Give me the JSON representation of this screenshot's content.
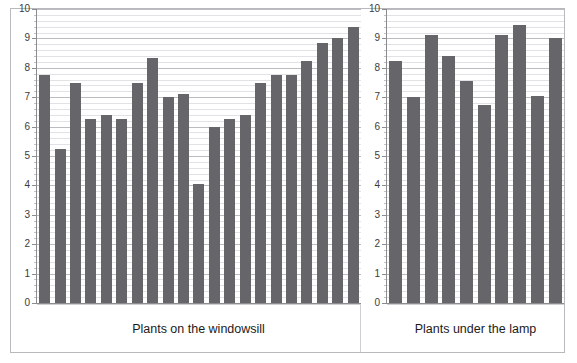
{
  "chart_data": {
    "type": "bar",
    "title": "",
    "xlabel": "",
    "ylabel": "",
    "ylim": [
      0,
      10
    ],
    "yticks": [
      0,
      1,
      2,
      3,
      4,
      5,
      6,
      7,
      8,
      9,
      10
    ],
    "ytick_labels": [
      "0",
      "1",
      "2",
      "3",
      "4",
      "5",
      "6",
      "7",
      "8",
      "9",
      "10"
    ],
    "grid": true,
    "minor_grid_step": 0.2,
    "legend": "none",
    "bar_color": "#66666a",
    "grid_color": "#bcbcc0",
    "minor_grid_color": "#e2e2e6",
    "axis_color": "#8c8c90",
    "panels": [
      {
        "label": "Plants on the windowsill",
        "values": [
          7.75,
          5.25,
          7.5,
          6.25,
          6.4,
          6.25,
          7.5,
          8.35,
          7.0,
          7.1,
          4.05,
          6.0,
          6.25,
          6.4,
          7.5,
          7.75,
          7.75,
          8.25,
          8.85,
          9.0,
          9.4
        ]
      },
      {
        "label": "Plants under the lamp",
        "values": [
          8.25,
          7.0,
          9.1,
          8.4,
          7.55,
          6.75,
          9.1,
          9.45,
          7.05,
          9.0
        ]
      }
    ]
  },
  "axes": {
    "left": {
      "labels": [
        "10",
        "9",
        "8",
        "7",
        "6",
        "5",
        "4",
        "3",
        "2",
        "1",
        "0"
      ]
    },
    "right": {
      "labels": [
        "10",
        "9",
        "8",
        "7",
        "6",
        "5",
        "4",
        "3",
        "2",
        "1",
        "0"
      ]
    }
  },
  "captions": {
    "left": "Plants on the windowsill",
    "right": "Plants under the lamp"
  }
}
